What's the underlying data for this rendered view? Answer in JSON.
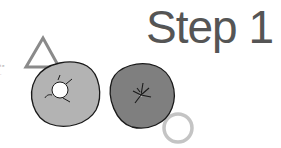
{
  "title": "Step 1",
  "side_note": "t e -",
  "shapes": {
    "triangle": {
      "label": "triangle-outline",
      "stroke": "#8a8a8a"
    },
    "left_donut": {
      "label": "light-donut-with-hole",
      "fill": "#b3b3b3",
      "outline": "#1a1a1a",
      "hole": "#ffffff"
    },
    "right_donut": {
      "label": "dark-donut-with-star-mark",
      "fill": "#7f7f7f",
      "outline": "#1a1a1a"
    },
    "small_ring": {
      "label": "small-ring-outline",
      "stroke": "#c4c4c4"
    }
  }
}
